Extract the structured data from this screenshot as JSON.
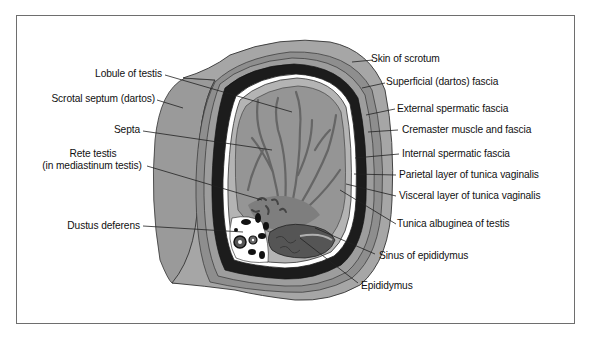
{
  "figure": {
    "type": "anatomical cross-section"
  },
  "labels_left": [
    {
      "id": "lobule",
      "text": "Lobule of testis"
    },
    {
      "id": "scrotal_septum",
      "text": "Scrotal septum (dartos)"
    },
    {
      "id": "septa",
      "text": "Septa"
    },
    {
      "id": "rete_testis_line1",
      "text": "Rete testis"
    },
    {
      "id": "rete_testis_line2",
      "text": "(in mediastinum testis)"
    },
    {
      "id": "ductus",
      "text": "Dustus deferens"
    }
  ],
  "labels_right": [
    {
      "id": "skin",
      "text": "Skin of scrotum"
    },
    {
      "id": "superficial",
      "text": "Superficial (dartos) fascia"
    },
    {
      "id": "external",
      "text": "External spermatic fascia"
    },
    {
      "id": "cremaster",
      "text": "Cremaster muscle and fascia"
    },
    {
      "id": "internal",
      "text": "Internal spermatic fascia"
    },
    {
      "id": "parietal",
      "text": "Parietal layer of tunica vaginalis"
    },
    {
      "id": "visceral",
      "text": "Visceral layer of tunica vaginalis"
    },
    {
      "id": "albuginea",
      "text": "Tunica albuginea of testis"
    },
    {
      "id": "sinus",
      "text": "Sinus of epididymus"
    },
    {
      "id": "epididymus",
      "text": "Epididymus"
    }
  ],
  "colors": {
    "frame": "#6e6e6e",
    "skin": "#9c9c9c",
    "fascia_light": "#a8a8a8",
    "fascia_mid": "#8a8a8a",
    "dark_layer": "#1c1c1c",
    "tunica_white": "#ffffff",
    "albuginea": "#b4b4b4",
    "testis": "#959595",
    "septa": "#6a6a6a",
    "epididymus": "#555555"
  }
}
